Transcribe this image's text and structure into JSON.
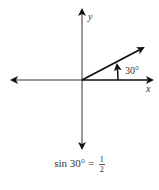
{
  "diagram": {
    "type": "unit-angle-on-axes",
    "x_axis_label": "x",
    "y_axis_label": "y",
    "angle_label": "30°",
    "angle_degrees": 30
  },
  "formula": {
    "function": "sin",
    "argument": "30°",
    "equals": "=",
    "numerator": "1",
    "denominator": "2"
  }
}
